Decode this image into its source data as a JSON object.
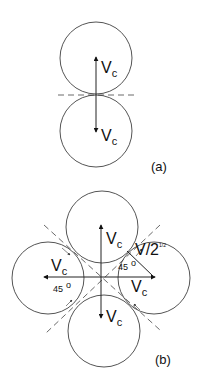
{
  "panel_a": {
    "label": "(a)",
    "top_velocity": {
      "main": "V",
      "sub": "c"
    },
    "bottom_velocity": {
      "main": "V",
      "sub": "c"
    }
  },
  "panel_b": {
    "label": "(b)",
    "top_velocity": {
      "main": "V",
      "sub": "c"
    },
    "bottom_velocity": {
      "main": "V",
      "sub": "c"
    },
    "left_velocity": {
      "main": "V",
      "sub": "c"
    },
    "right_velocity": {
      "main": "V",
      "sub": "c"
    },
    "diagonal_velocity": {
      "main": "V/2",
      "sup": "1/2"
    },
    "angle_left": {
      "value": "45",
      "unit": "o"
    },
    "angle_right": {
      "value": "45",
      "unit": "o"
    }
  }
}
